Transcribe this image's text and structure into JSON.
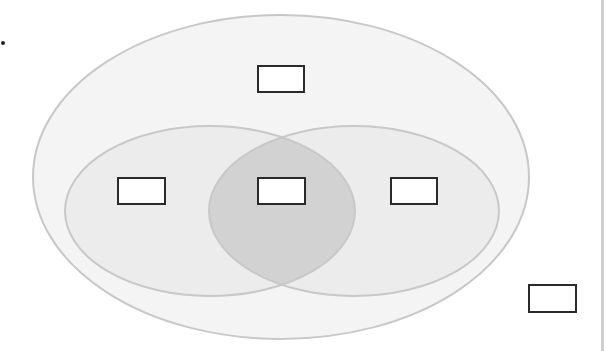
{
  "diagram": {
    "type": "venn",
    "colors": {
      "background": "#ffffff",
      "outer_fill": "#f4f4f4",
      "inner_fill": "#ececec",
      "intersection_fill": "#d2d2d2",
      "outline": "#c8c8c8",
      "box_border": "#2a2a2a",
      "right_rule": "#cfcfcf"
    },
    "shapes": {
      "outer": {
        "cx": 281,
        "cy": 177,
        "rx": 248,
        "ry": 162
      },
      "left": {
        "cx": 210,
        "cy": 211,
        "rx": 145,
        "ry": 85
      },
      "right": {
        "cx": 354,
        "cy": 211,
        "rx": 145,
        "ry": 85
      }
    },
    "boxes": [
      {
        "id": "outer-only",
        "label": "",
        "x": 257,
        "y": 65,
        "w": 48,
        "h": 28
      },
      {
        "id": "left-only",
        "label": "",
        "x": 117,
        "y": 177,
        "w": 49,
        "h": 28
      },
      {
        "id": "intersection",
        "label": "",
        "x": 257,
        "y": 177,
        "w": 49,
        "h": 28
      },
      {
        "id": "right-only",
        "label": "",
        "x": 390,
        "y": 177,
        "w": 48,
        "h": 28
      },
      {
        "id": "outside",
        "label": "",
        "x": 528,
        "y": 284,
        "w": 49,
        "h": 29
      }
    ]
  }
}
